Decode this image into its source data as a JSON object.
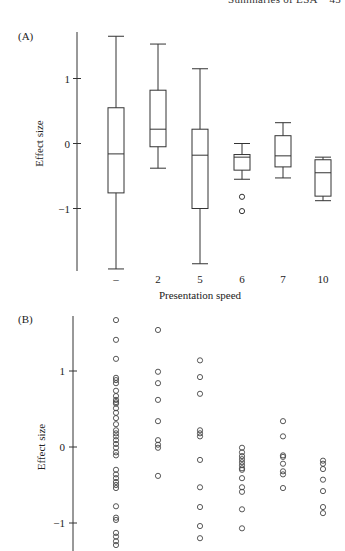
{
  "page": {
    "running_header": "Summaries of ESA    45",
    "panel_a_label": "(A)",
    "panel_b_label": "(B)"
  },
  "chart_data": [
    {
      "id": "A",
      "type": "boxplot",
      "title": "",
      "xlabel": "Presentation speed",
      "ylabel": "Effect size",
      "categories": [
        "–",
        "2",
        "5",
        "6",
        "7",
        "10"
      ],
      "yticks": [
        -1,
        0,
        1
      ],
      "ylim": [
        -2.0,
        1.75
      ],
      "grid": false,
      "boxes": [
        {
          "category": "–",
          "whisker_low": -1.93,
          "q1": -0.76,
          "median": -0.16,
          "q3": 0.55,
          "whisker_high": 1.65,
          "outliers": []
        },
        {
          "category": "2",
          "whisker_low": -0.38,
          "q1": -0.05,
          "median": 0.22,
          "q3": 0.82,
          "whisker_high": 1.53,
          "outliers": []
        },
        {
          "category": "5",
          "whisker_low": -1.85,
          "q1": -1.0,
          "median": -0.18,
          "q3": 0.22,
          "whisker_high": 1.15,
          "outliers": []
        },
        {
          "category": "6",
          "whisker_low": -0.55,
          "q1": -0.41,
          "median": -0.21,
          "q3": -0.17,
          "whisker_high": 0.0,
          "outliers": [
            -0.82,
            -1.04
          ]
        },
        {
          "category": "7",
          "whisker_low": -0.53,
          "q1": -0.36,
          "median": -0.19,
          "q3": 0.12,
          "whisker_high": 0.32,
          "outliers": []
        },
        {
          "category": "10",
          "whisker_low": -0.88,
          "q1": -0.81,
          "median": -0.45,
          "q3": -0.25,
          "whisker_high": -0.21,
          "outliers": []
        }
      ]
    },
    {
      "id": "B",
      "type": "scatter",
      "title": "",
      "xlabel": "",
      "ylabel": "Effect size",
      "yticks": [
        -1,
        0,
        1
      ],
      "ylim": [
        -1.4,
        1.75
      ],
      "grid": false,
      "series": [
        {
          "name": "–",
          "values": [
            1.67,
            1.41,
            1.16,
            0.91,
            0.88,
            0.84,
            0.74,
            0.67,
            0.62,
            0.59,
            0.57,
            0.51,
            0.45,
            0.38,
            0.3,
            0.22,
            0.18,
            0.14,
            0.09,
            0.04,
            -0.01,
            -0.07,
            -0.11,
            -0.3,
            -0.36,
            -0.41,
            -0.46,
            -0.5,
            -0.54,
            -0.78,
            -0.93,
            -0.96,
            -1.13,
            -1.18,
            -1.24,
            -1.29
          ]
        },
        {
          "name": "2",
          "values": [
            1.54,
            0.99,
            0.84,
            0.62,
            0.34,
            0.09,
            0.03,
            -0.01,
            -0.38
          ]
        },
        {
          "name": "5",
          "values": [
            1.14,
            0.92,
            0.7,
            0.22,
            0.18,
            0.14,
            -0.17,
            -0.53,
            -0.79,
            -1.04,
            -1.2
          ]
        },
        {
          "name": "6",
          "values": [
            -0.01,
            -0.07,
            -0.12,
            -0.16,
            -0.2,
            -0.24,
            -0.28,
            -0.3,
            -0.41,
            -0.53,
            -0.59,
            -0.82,
            -1.07
          ]
        },
        {
          "name": "7",
          "values": [
            0.34,
            0.14,
            -0.11,
            -0.13,
            -0.22,
            -0.32,
            -0.36,
            -0.54
          ]
        },
        {
          "name": "10",
          "values": [
            -0.18,
            -0.22,
            -0.29,
            -0.43,
            -0.58,
            -0.79,
            -0.87
          ]
        }
      ]
    }
  ]
}
